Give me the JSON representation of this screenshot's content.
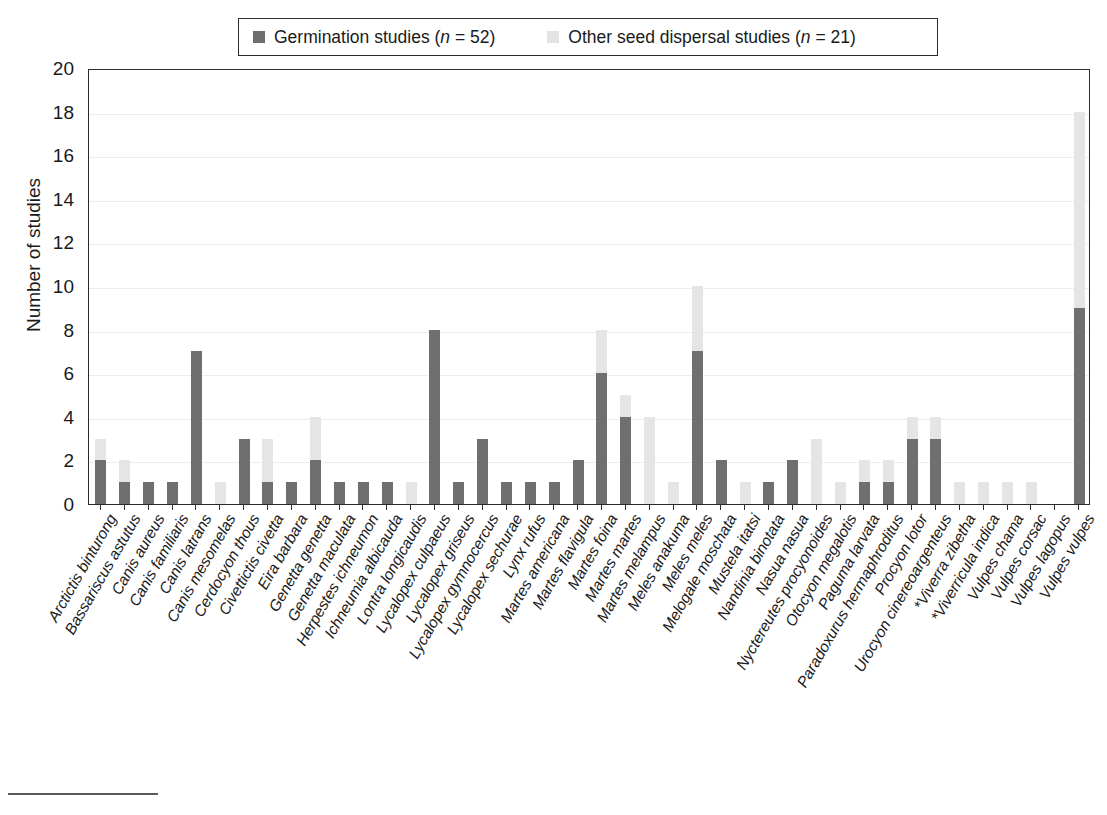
{
  "legend": {
    "entries": [
      {
        "label_prefix": "Germination studies (",
        "label_italic": "n",
        "label_suffix": " = 52)",
        "color": "#6e6e6e",
        "swatch": "dark"
      },
      {
        "label_prefix": "Other seed dispersal studies (",
        "label_italic": "n",
        "label_suffix": " = 21)",
        "color": "#e3e3e3",
        "swatch": "light"
      }
    ]
  },
  "axes": {
    "y_title": "Number of studies",
    "y_ticks": [
      "0",
      "2",
      "4",
      "6",
      "8",
      "10",
      "12",
      "14",
      "16",
      "18",
      "20"
    ]
  },
  "chart_data": {
    "type": "bar",
    "title": "",
    "subtitle": "",
    "xlabel": "",
    "ylabel": "Number of studies",
    "ylim": [
      0,
      20
    ],
    "ytick_step": 2,
    "grid": true,
    "stacked": true,
    "legend_position": "top",
    "colors": {
      "germination": "#6f6f6f",
      "other": "#e5e5e5"
    },
    "categories": [
      "Arctictis binturong",
      "Bassariscus astutus",
      "Canis aureus",
      "Canis familiaris",
      "Canis latrans",
      "Canis mesomelas",
      "Cerdocyon thous",
      "Civettictis civetta",
      "Eira barbara",
      "Genetta genetta",
      "Genetta maculata",
      "Herpestes ichneumon",
      "Ichneumia albicauda",
      "Lontra longicaudis",
      "Lycalopex culpaeus",
      "Lycalopex griseus",
      "Lycalopex gymnocercus",
      "Lycalopex sechurae",
      "Lynx rufus",
      "Martes americana",
      "Martes flavigula",
      "Martes foina",
      "Martes martes",
      "Martes melampus",
      "Meles anakuma",
      "Meles meles",
      "Melogale moschata",
      "Mustela itatsi",
      "Nandinia binotata",
      "Nasua nasua",
      "Nyctereutes procyonoides",
      "Otocyon megalotis",
      "Paguma larvata",
      "Paradoxurus hermaphroditus",
      "Procyon lotor",
      "Urocyon cinereoargenteus",
      "*Viverra zibetha",
      "*Viverricula indica",
      "Vulpes chama",
      "Vulpes corsac",
      "Vulpes lagopus",
      "Vulpes vulpes"
    ],
    "series": [
      {
        "name": "Germination studies (n = 52)",
        "values": [
          2,
          1,
          1,
          1,
          7,
          0,
          3,
          1,
          1,
          2,
          1,
          1,
          1,
          0,
          8,
          1,
          3,
          1,
          1,
          1,
          2,
          6,
          4,
          0,
          0,
          7,
          2,
          0,
          1,
          2,
          0,
          0,
          1,
          1,
          3,
          3,
          0,
          0,
          0,
          0,
          0,
          9
        ]
      },
      {
        "name": "Other seed dispersal studies (n = 21)",
        "values": [
          1,
          1,
          0,
          0,
          0,
          1,
          0,
          2,
          0,
          2,
          0,
          0,
          0,
          1,
          0,
          0,
          0,
          0,
          0,
          0,
          0,
          2,
          1,
          4,
          1,
          3,
          0,
          1,
          0,
          0,
          3,
          1,
          1,
          1,
          1,
          1,
          1,
          1,
          1,
          1,
          0,
          9
        ]
      }
    ],
    "totals": [
      3,
      2,
      1,
      1,
      7,
      1,
      3,
      3,
      1,
      4,
      1,
      1,
      1,
      1,
      8,
      1,
      3,
      1,
      1,
      1,
      2,
      8,
      5,
      4,
      1,
      10,
      2,
      1,
      1,
      2,
      3,
      1,
      2,
      2,
      4,
      4,
      1,
      1,
      1,
      1,
      0,
      18
    ]
  }
}
